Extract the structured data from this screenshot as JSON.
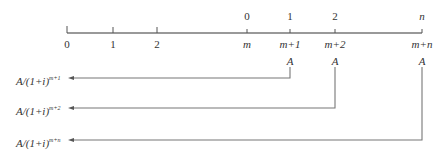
{
  "diagram": {
    "type": "timeline-cashflow",
    "timeline": {
      "bottom_ticks": [
        {
          "label": "0",
          "x": 67,
          "italic": false
        },
        {
          "label": "1",
          "x": 113,
          "italic": false
        },
        {
          "label": "2",
          "x": 157,
          "italic": false
        },
        {
          "label": "m",
          "x": 247,
          "italic": true
        },
        {
          "label": "m+1",
          "x": 290,
          "italic": true
        },
        {
          "label": "m+2",
          "x": 335,
          "italic": true
        },
        {
          "label": "m+n",
          "x": 422,
          "italic": true
        }
      ],
      "top_labels": [
        {
          "label": "0",
          "x": 247
        },
        {
          "label": "1",
          "x": 290
        },
        {
          "label": "2",
          "x": 335
        },
        {
          "label": "n",
          "x": 422,
          "italic": true
        }
      ]
    },
    "payments": [
      {
        "amount": "A",
        "x": 290,
        "arrow_y": 78,
        "pv_label": "A/(1+i)",
        "pv_exp": "m+1"
      },
      {
        "amount": "A",
        "x": 335,
        "arrow_y": 108,
        "pv_label": "A/(1+i)",
        "pv_exp": "m+2"
      },
      {
        "amount": "A",
        "x": 422,
        "arrow_y": 140,
        "pv_label": "A/(1+i)",
        "pv_exp": "m+n"
      }
    ]
  }
}
